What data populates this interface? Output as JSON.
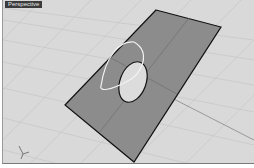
{
  "viewport": {
    "label": "Perspective",
    "background": "#d9d9d9",
    "grid_color": "#c4c4c4",
    "surface": {
      "name": "planar surface with hole",
      "fill": "#8c8c8c",
      "edge_color": "#111111",
      "corners": [
        [
          155,
          10
        ],
        [
          220,
          27
        ],
        [
          133,
          162
        ],
        [
          64,
          105
        ]
      ]
    },
    "hole": {
      "cx": 132,
      "cy": 82,
      "rx": 13,
      "ry": 21,
      "rotation": 20,
      "fill": "#dcdcdc"
    },
    "highlight_arc_color": "#f0f0f0"
  }
}
